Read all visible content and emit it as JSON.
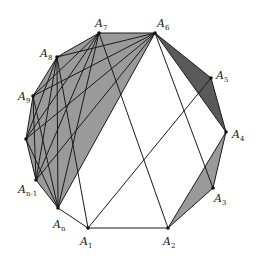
{
  "diagram": {
    "title": "",
    "colors": {
      "light_shade": "#9a9a9a",
      "dark_shade": "#5a5a5a",
      "line": "#1a1a1a",
      "background": "#ffffff"
    },
    "vertices": [
      {
        "id": "A1",
        "base": "A",
        "sub": "1",
        "x": 88,
        "y": 228,
        "lx": 80,
        "ly": 238
      },
      {
        "id": "A2",
        "base": "A",
        "sub": "2",
        "x": 168,
        "y": 228,
        "lx": 163,
        "ly": 238
      },
      {
        "id": "A3",
        "base": "A",
        "sub": "3",
        "x": 213,
        "y": 188,
        "lx": 214,
        "ly": 195
      },
      {
        "id": "A4",
        "base": "A",
        "sub": "4",
        "x": 226,
        "y": 132,
        "lx": 232,
        "ly": 131
      },
      {
        "id": "A5",
        "base": "A",
        "sub": "5",
        "x": 211,
        "y": 78,
        "lx": 216,
        "ly": 71
      },
      {
        "id": "A6",
        "base": "A",
        "sub": "6",
        "x": 155,
        "y": 33,
        "lx": 157,
        "ly": 20
      },
      {
        "id": "A7",
        "base": "A",
        "sub": "7",
        "x": 99,
        "y": 33,
        "lx": 95,
        "ly": 20
      },
      {
        "id": "A8",
        "base": "A",
        "sub": "8",
        "x": 57,
        "y": 57,
        "lx": 40,
        "ly": 50
      },
      {
        "id": "A9",
        "base": "A",
        "sub": "9",
        "x": 33,
        "y": 96,
        "lx": 18,
        "ly": 92
      },
      {
        "id": "V",
        "base": "",
        "sub": "",
        "x": 26,
        "y": 139,
        "lx": 0,
        "ly": 0
      },
      {
        "id": "An-1",
        "base": "A",
        "sub": "n-1",
        "x": 36,
        "y": 180,
        "lx": 18,
        "ly": 186
      },
      {
        "id": "An",
        "base": "A",
        "sub": "n",
        "x": 58,
        "y": 208,
        "lx": 53,
        "ly": 222
      }
    ],
    "labels": [
      {
        "id": "A1",
        "base": "A",
        "sub": "1"
      },
      {
        "id": "A2",
        "base": "A",
        "sub": "2"
      },
      {
        "id": "A3",
        "base": "A",
        "sub": "3"
      },
      {
        "id": "A4",
        "base": "A",
        "sub": "4"
      },
      {
        "id": "A5",
        "base": "A",
        "sub": "5"
      },
      {
        "id": "A6",
        "base": "A",
        "sub": "6"
      },
      {
        "id": "A7",
        "base": "A",
        "sub": "7"
      },
      {
        "id": "A8",
        "base": "A",
        "sub": "8"
      },
      {
        "id": "A9",
        "base": "A",
        "sub": "9"
      },
      {
        "id": "An-1",
        "base": "A",
        "sub": "n-1"
      },
      {
        "id": "An",
        "base": "A",
        "sub": "n"
      }
    ],
    "shaded_regions": [
      {
        "name": "left-complete-region",
        "vertices": [
          "A7",
          "A6",
          "An",
          "An-1",
          "V",
          "A9",
          "A8"
        ],
        "shade": "light"
      },
      {
        "name": "triangle-A6-A5-A4",
        "vertices": [
          "A6",
          "A5",
          "A4"
        ],
        "shade": "dark"
      },
      {
        "name": "triangle-A2-A3-A4",
        "vertices": [
          "A2",
          "A3",
          "A4"
        ],
        "shade": "light"
      }
    ],
    "extra_segments": [
      [
        "A1",
        "A5"
      ],
      [
        "A7",
        "A2"
      ],
      [
        "A6",
        "A3"
      ],
      [
        "A8",
        "A1"
      ],
      [
        "A1",
        "A2"
      ],
      [
        "A1",
        "An"
      ]
    ]
  }
}
